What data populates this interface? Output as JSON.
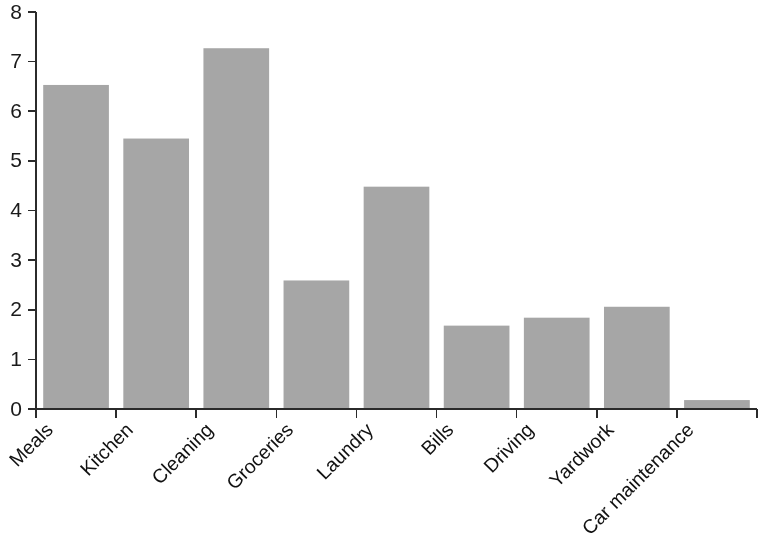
{
  "chart_data": {
    "type": "bar",
    "title": "",
    "subtitle": "",
    "xlabel": "",
    "ylabel": "",
    "categories": [
      "Meals",
      "Kitchen",
      "Cleaning",
      "Groceries",
      "Laundry",
      "Bills",
      "Driving",
      "Yardwork",
      "Car maintenance"
    ],
    "values": [
      6.53,
      5.45,
      7.27,
      2.59,
      4.48,
      1.68,
      1.84,
      2.06,
      0.18
    ],
    "series": [
      {
        "name": "",
        "values": [
          6.53,
          5.45,
          7.27,
          2.59,
          4.48,
          1.68,
          1.84,
          2.06,
          0.18
        ]
      }
    ],
    "ylim": [
      0,
      8
    ],
    "ytick_labels": [
      "0",
      "1",
      "2",
      "3",
      "4",
      "5",
      "6",
      "7",
      "8"
    ],
    "ytick_values": [
      0,
      1,
      2,
      3,
      4,
      5,
      6,
      7,
      8
    ],
    "grid": false,
    "legend": false,
    "legend_position": "none",
    "bar_color": "#a6a6a6",
    "axis_color": "#2b2b2b",
    "xtick_label_rotation": 45,
    "annotations": []
  }
}
